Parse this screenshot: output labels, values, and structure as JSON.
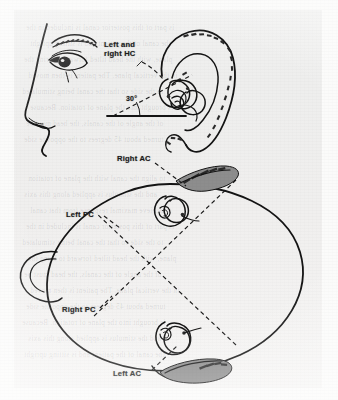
{
  "figure": {
    "kind": "anatomical-line-drawing",
    "medium": "photocopied book figure",
    "views": [
      {
        "id": "lateral",
        "name": "Lateral head profile with ear and labyrinth",
        "description": "Side view of a face showing nose, eye, eyebrow and external ear with the bony labyrinth superimposed over the ear; a horizontal baseline and a dashed line through the labyrinth form a measured angle."
      },
      {
        "id": "superior",
        "name": "Superior (top-down) view of head",
        "description": "Oval top view of the head with nose at bottom and left ear at left, containing two labyrinths and crossed dashed lines indicating semicircular canal planes."
      }
    ],
    "labels": {
      "hc": "Left and\nright HC",
      "hc_line1": "Left and",
      "hc_line2": "right HC",
      "angle": "30°",
      "right_ac": "Right AC",
      "left_pc": "Left PC",
      "right_pc": "Right PC",
      "left_ac": "Left AC"
    },
    "annotations": {
      "angle_value": 30,
      "angle_unit": "degrees",
      "canal_abbreviations": {
        "HC": "horizontal canal",
        "AC": "anterior canal",
        "PC": "posterior canal"
      }
    },
    "colors": {
      "ink": "#141414",
      "paper": "#f0efee",
      "dashed_line": "#1a1a1a",
      "ghost_text": "#5a5a5f"
    },
    "ghost_text_lines": [
      "is part of this posterior canal is included in the",
      "the canal of the patient and is sitting upright",
      "plane, with the head tilted forward to bring the",
      "in the vertical plane. The patient is then moved",
      "to the side so that the canal being stimulated",
      "is brought into the plane of rotation. Because",
      "of the angle of the canals, the head must be",
      "turned about 45 degrees to the opposite side",
      "to align the canal with the plane of rotation",
      "and the stimulus is applied along this axis",
      "to achieve maximal response from that canal"
    ]
  }
}
